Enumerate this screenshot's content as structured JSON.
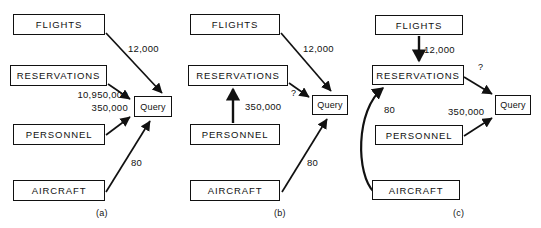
{
  "figure": {
    "panels": [
      {
        "id": "a",
        "caption": "(a)",
        "nodes": [
          {
            "name": "flights",
            "label": "FLIGHTS",
            "x": 13,
            "y": 14,
            "w": 92,
            "h": 21
          },
          {
            "name": "reservations",
            "label": "RESERVATIONS",
            "x": 10,
            "y": 65,
            "w": 97,
            "h": 21
          },
          {
            "name": "personnel",
            "label": "PERSONNEL",
            "x": 13,
            "y": 124,
            "w": 92,
            "h": 21
          },
          {
            "name": "aircraft",
            "label": "AIRCRAFT",
            "x": 13,
            "y": 180,
            "w": 92,
            "h": 21
          },
          {
            "name": "query",
            "label": "Query",
            "x": 134,
            "y": 96,
            "w": 38,
            "h": 21
          }
        ],
        "edges": [
          {
            "name": "flights-to-query",
            "label": "12,000",
            "lx": 128,
            "ly": 43,
            "align": "left"
          },
          {
            "name": "reservations-to-query",
            "label": "10,950,000",
            "lx": 33,
            "ly": 89,
            "align": "right",
            "lw": 95
          },
          {
            "name": "personnel-to-query",
            "label": "350,000",
            "lx": 33,
            "ly": 102,
            "align": "right",
            "lw": 95
          },
          {
            "name": "aircraft-to-query",
            "label": "80",
            "lx": 131,
            "ly": 157,
            "align": "left"
          }
        ]
      },
      {
        "id": "b",
        "caption": "(b)",
        "nodes": [
          {
            "name": "flights",
            "label": "FLIGHTS",
            "x": 190,
            "y": 14,
            "w": 90,
            "h": 21
          },
          {
            "name": "reservations",
            "label": "RESERVATIONS",
            "x": 188,
            "y": 65,
            "w": 100,
            "h": 21
          },
          {
            "name": "personnel",
            "label": "PERSONNEL",
            "x": 190,
            "y": 124,
            "w": 90,
            "h": 21
          },
          {
            "name": "aircraft",
            "label": "AIRCRAFT",
            "x": 190,
            "y": 180,
            "w": 90,
            "h": 21
          },
          {
            "name": "query",
            "label": "Query",
            "x": 312,
            "y": 95,
            "w": 36,
            "h": 20
          }
        ],
        "edges": [
          {
            "name": "flights-to-query",
            "label": "12,000",
            "lx": 303,
            "ly": 43,
            "align": "left"
          },
          {
            "name": "reservations-to-query",
            "label": "?",
            "lx": 291,
            "ly": 88,
            "align": "left"
          },
          {
            "name": "personnel-to-reservations",
            "label": "350,000",
            "lx": 245,
            "ly": 101,
            "align": "left"
          },
          {
            "name": "aircraft-to-query",
            "label": "80",
            "lx": 307,
            "ly": 157,
            "align": "left"
          }
        ]
      },
      {
        "id": "c",
        "caption": "(c)",
        "nodes": [
          {
            "name": "flights",
            "label": "FLIGHTS",
            "x": 375,
            "y": 15,
            "w": 88,
            "h": 20
          },
          {
            "name": "reservations",
            "label": "RESERVATIONS",
            "x": 372,
            "y": 65,
            "w": 92,
            "h": 20
          },
          {
            "name": "personnel",
            "label": "PERSONNEL",
            "x": 375,
            "y": 125,
            "w": 88,
            "h": 20
          },
          {
            "name": "aircraft",
            "label": "AIRCRAFT",
            "x": 372,
            "y": 180,
            "w": 88,
            "h": 20
          },
          {
            "name": "query",
            "label": "Query",
            "x": 495,
            "y": 95,
            "w": 36,
            "h": 20
          }
        ],
        "edges": [
          {
            "name": "flights-to-reservations",
            "label": "12,000",
            "lx": 424,
            "ly": 44,
            "align": "left"
          },
          {
            "name": "reservations-to-query",
            "label": "?",
            "lx": 478,
            "ly": 62,
            "align": "left"
          },
          {
            "name": "aircraft-to-reservations",
            "label": "80",
            "lx": 384,
            "ly": 104,
            "align": "left"
          },
          {
            "name": "personnel-to-query",
            "label": "350,000",
            "lx": 448,
            "ly": 106,
            "align": "left"
          }
        ]
      }
    ],
    "captions": [
      {
        "name": "panel-caption-a",
        "text": "(a)",
        "x": 96,
        "y": 208
      },
      {
        "name": "panel-caption-b",
        "text": "(b)",
        "x": 274,
        "y": 208
      },
      {
        "name": "panel-caption-c",
        "text": "(c)",
        "x": 453,
        "y": 208
      }
    ],
    "colors": {
      "stroke": "#111111",
      "background": "#ffffff",
      "text": "#111111"
    }
  }
}
